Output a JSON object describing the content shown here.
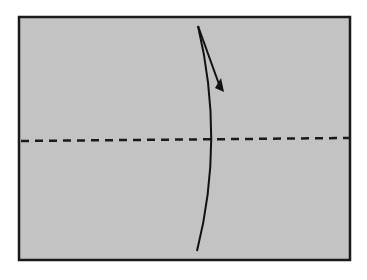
{
  "diagram": {
    "type": "origami-fold-step",
    "paper": {
      "x": 19,
      "y": 17,
      "width": 331,
      "height": 243,
      "fill": "#c3c3c3",
      "stroke": "#1a1a1a",
      "stroke_width": 2.5
    },
    "valley_fold_line": {
      "y_left": 141,
      "y_right": 138,
      "dash": "8 6",
      "stroke": "#1a1a1a",
      "stroke_width": 2.5,
      "label": "valley fold"
    },
    "fold_arrow": {
      "label": "fold top edge down",
      "curve_path": "M 198 26 Q 225 140 197 251",
      "arrow_path": "M 198 26 L 220 87",
      "arrowhead_points": "215,88 224,92 221,78",
      "stroke": "#111111",
      "stroke_width": 2
    }
  }
}
